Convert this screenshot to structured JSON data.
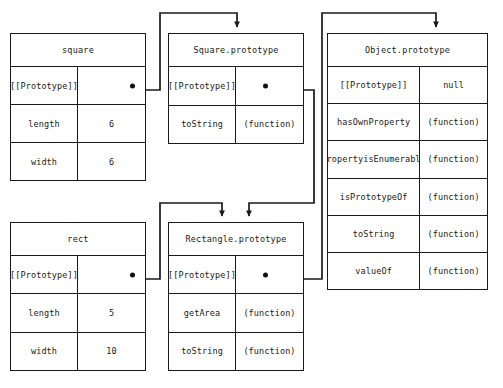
{
  "diagram": {
    "colors": {
      "line": "#1a1a1a",
      "background": "#ffffff",
      "dot": "#111111"
    },
    "boxes": [
      {
        "id": "square",
        "title": "square",
        "rows": [
          {
            "key": "[[Prototype]]",
            "value": "",
            "pointer": true
          },
          {
            "key": "length",
            "value": "6",
            "pointer": false
          },
          {
            "key": "width",
            "value": "6",
            "pointer": false
          }
        ]
      },
      {
        "id": "square-prototype",
        "title": "Square.prototype",
        "rows": [
          {
            "key": "[[Prototype]]",
            "value": "",
            "pointer": true
          },
          {
            "key": "toString",
            "value": "(function)",
            "pointer": false
          }
        ]
      },
      {
        "id": "object-prototype",
        "title": "Object.prototype",
        "rows": [
          {
            "key": "[[Prototype]]",
            "value": "null",
            "pointer": false
          },
          {
            "key": "hasOwnProperty",
            "value": "(function)",
            "pointer": false
          },
          {
            "key": "propertyisEnumerable",
            "value": "(function)",
            "pointer": false
          },
          {
            "key": "isPrototypeOf",
            "value": "(function)",
            "pointer": false
          },
          {
            "key": "toString",
            "value": "(function)",
            "pointer": false
          },
          {
            "key": "valueOf",
            "value": "(function)",
            "pointer": false
          }
        ]
      },
      {
        "id": "rect",
        "title": "rect",
        "rows": [
          {
            "key": "[[Prototype]]",
            "value": "",
            "pointer": true
          },
          {
            "key": "length",
            "value": "5",
            "pointer": false
          },
          {
            "key": "width",
            "value": "10",
            "pointer": false
          }
        ]
      },
      {
        "id": "rectangle-prototype",
        "title": "Rectangle.prototype",
        "rows": [
          {
            "key": "[[Prototype]]",
            "value": "",
            "pointer": true
          },
          {
            "key": "getArea",
            "value": "(function)",
            "pointer": false
          },
          {
            "key": "toString",
            "value": "(function)",
            "pointer": false
          }
        ]
      }
    ],
    "connectors": [
      {
        "id": "square-to-square-prototype",
        "from": "square.[[Prototype]]",
        "to": "Square.prototype"
      },
      {
        "id": "square-prototype-to-rectangle-prototype",
        "from": "Square.prototype.[[Prototype]]",
        "to": "Rectangle.prototype"
      },
      {
        "id": "rect-to-rectangle-prototype",
        "from": "rect.[[Prototype]]",
        "to": "Rectangle.prototype"
      },
      {
        "id": "rectangle-prototype-to-object-prototype",
        "from": "Rectangle.prototype.[[Prototype]]",
        "to": "Object.prototype"
      }
    ]
  }
}
